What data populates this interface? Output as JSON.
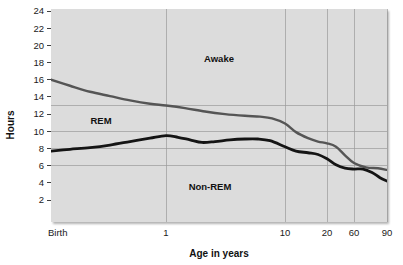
{
  "chart_data": {
    "type": "area",
    "title": "",
    "subtitle": "",
    "xlabel": "Age in years",
    "ylabel": "Hours",
    "grid": true,
    "legend": false,
    "legend_position": "inline-annotations",
    "x_tick_labels": [
      "Birth",
      "1",
      "10",
      "20",
      "60",
      "90"
    ],
    "x_tick_values": [
      0,
      1,
      10,
      20,
      60,
      90
    ],
    "x_tick_positions_px": [
      51,
      166,
      285,
      327,
      354,
      387
    ],
    "y_tick_labels": [
      "2",
      "4",
      "6",
      "8",
      "10",
      "12",
      "14",
      "16",
      "18",
      "20",
      "22",
      "24"
    ],
    "y_tick_values": [
      2,
      4,
      6,
      8,
      10,
      12,
      14,
      16,
      18,
      20,
      22,
      24
    ],
    "ylim": [
      0,
      24
    ],
    "y_gridlines": [
      6,
      8,
      10,
      13
    ],
    "annotations": [
      {
        "text": "Awake",
        "x_px": 219,
        "y_px": 62
      },
      {
        "text": "REM",
        "x_px": 101,
        "y_px": 124
      },
      {
        "text": "Non-REM",
        "x_px": 210,
        "y_px": 190
      }
    ],
    "series": [
      {
        "name": "total-sleep-upper-boundary",
        "description": "Upper boundary: total sleep hours (below line = sleep, above line = awake)",
        "color": "#555555",
        "points": [
          {
            "x_px": 51,
            "hours": 16.0
          },
          {
            "x_px": 70,
            "hours": 15.3
          },
          {
            "x_px": 90,
            "hours": 14.6
          },
          {
            "x_px": 110,
            "hours": 14.1
          },
          {
            "x_px": 130,
            "hours": 13.6
          },
          {
            "x_px": 150,
            "hours": 13.2
          },
          {
            "x_px": 166,
            "hours": 13.0
          },
          {
            "x_px": 185,
            "hours": 12.7
          },
          {
            "x_px": 205,
            "hours": 12.3
          },
          {
            "x_px": 225,
            "hours": 12.0
          },
          {
            "x_px": 245,
            "hours": 11.8
          },
          {
            "x_px": 260,
            "hours": 11.7
          },
          {
            "x_px": 272,
            "hours": 11.5
          },
          {
            "x_px": 285,
            "hours": 10.9
          },
          {
            "x_px": 296,
            "hours": 9.9
          },
          {
            "x_px": 308,
            "hours": 9.2
          },
          {
            "x_px": 318,
            "hours": 8.8
          },
          {
            "x_px": 327,
            "hours": 8.6
          },
          {
            "x_px": 336,
            "hours": 8.2
          },
          {
            "x_px": 345,
            "hours": 7.2
          },
          {
            "x_px": 354,
            "hours": 6.3
          },
          {
            "x_px": 366,
            "hours": 5.8
          },
          {
            "x_px": 378,
            "hours": 5.7
          },
          {
            "x_px": 387,
            "hours": 5.5
          }
        ]
      },
      {
        "name": "non-rem-upper-boundary",
        "description": "Lower boundary: non-REM sleep hours (below line = Non-REM, band between lines = REM)",
        "color": "#141414",
        "points": [
          {
            "x_px": 51,
            "hours": 7.7
          },
          {
            "x_px": 70,
            "hours": 7.9
          },
          {
            "x_px": 90,
            "hours": 8.1
          },
          {
            "x_px": 110,
            "hours": 8.4
          },
          {
            "x_px": 130,
            "hours": 8.8
          },
          {
            "x_px": 150,
            "hours": 9.2
          },
          {
            "x_px": 166,
            "hours": 9.5
          },
          {
            "x_px": 178,
            "hours": 9.3
          },
          {
            "x_px": 190,
            "hours": 9.0
          },
          {
            "x_px": 202,
            "hours": 8.7
          },
          {
            "x_px": 215,
            "hours": 8.8
          },
          {
            "x_px": 230,
            "hours": 9.0
          },
          {
            "x_px": 245,
            "hours": 9.1
          },
          {
            "x_px": 258,
            "hours": 9.1
          },
          {
            "x_px": 270,
            "hours": 8.9
          },
          {
            "x_px": 285,
            "hours": 8.2
          },
          {
            "x_px": 296,
            "hours": 7.7
          },
          {
            "x_px": 308,
            "hours": 7.5
          },
          {
            "x_px": 318,
            "hours": 7.3
          },
          {
            "x_px": 327,
            "hours": 6.8
          },
          {
            "x_px": 336,
            "hours": 6.1
          },
          {
            "x_px": 345,
            "hours": 5.7
          },
          {
            "x_px": 354,
            "hours": 5.6
          },
          {
            "x_px": 363,
            "hours": 5.6
          },
          {
            "x_px": 372,
            "hours": 5.2
          },
          {
            "x_px": 380,
            "hours": 4.6
          },
          {
            "x_px": 387,
            "hours": 4.2
          }
        ]
      }
    ],
    "regions": [
      {
        "name": "Awake",
        "location": "above upper curve"
      },
      {
        "name": "REM",
        "location": "between the two curves"
      },
      {
        "name": "Non-REM",
        "location": "below lower curve"
      }
    ],
    "colors": {
      "plot_background": "#dcdcdc",
      "page_background": "#ffffff",
      "gridline": "#9a9a9a",
      "upper_curve": "#555555",
      "lower_curve": "#141414",
      "text": "#111111"
    },
    "plot_area_px": {
      "left": 51,
      "top": 9,
      "right": 387,
      "bottom": 222
    }
  }
}
